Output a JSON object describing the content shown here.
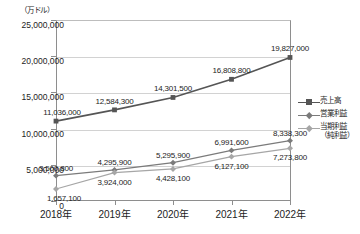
{
  "chart_data": {
    "type": "line",
    "title": "",
    "unit_label": "（万ドル）",
    "xlabel": "",
    "ylabel": "",
    "grid": true,
    "legend_position": "right",
    "categories": [
      "2018年",
      "2019年",
      "2020年",
      "2021年",
      "2022年"
    ],
    "ylim": [
      0,
      25000000
    ],
    "yticks": [
      0,
      5000000,
      10000000,
      15000000,
      20000000,
      25000000
    ],
    "ytick_labels": [
      "0",
      "5,000,000",
      "10,000,000",
      "15,000,000",
      "20,000,000",
      "25,000,000"
    ],
    "series": [
      {
        "name": "売上高",
        "marker": "square",
        "color": "#555555",
        "values": [
          11036000,
          12584300,
          14301500,
          16808800,
          19827000
        ],
        "labels": [
          "11,036,000",
          "12,584,300",
          "14,301,500",
          "16,808,800",
          "19,827,000"
        ]
      },
      {
        "name": "営業利益",
        "marker": "diamond",
        "color": "#7b7b7b",
        "values": [
          3500800,
          4295900,
          5295900,
          6991600,
          8338300
        ],
        "labels": [
          "3,500,800",
          "4,295,900",
          "5,295,900",
          "6,991,600",
          "8,338,300"
        ]
      },
      {
        "name": "当期利益（純利益）",
        "name_line1": "当期利益",
        "name_line2": "（純利益）",
        "marker": "diamond",
        "color": "#a6a6a6",
        "values": [
          1657100,
          3924000,
          4428100,
          6127100,
          7273800
        ],
        "labels": [
          "1,657,100",
          "3,924,000",
          "4,428,100",
          "6,127,100",
          "7,273,800"
        ]
      }
    ]
  },
  "axis": {
    "ytick_0": "0",
    "ytick_1": "5,000,000",
    "ytick_2": "10,000,000",
    "ytick_3": "15,000,000",
    "ytick_4": "20,000,000",
    "ytick_5": "25,000,000",
    "xtick_0": "2018年",
    "xtick_1": "2019年",
    "xtick_2": "2020年",
    "xtick_3": "2021年",
    "xtick_4": "2022年"
  },
  "legend": {
    "item_0": "売上高",
    "item_1": "営業利益",
    "item_2_line1": "当期利益",
    "item_2_line2": "（純利益）"
  },
  "labels": {
    "unit": "（万ドル）",
    "sales": [
      "11,036,000",
      "12,584,300",
      "14,301,500",
      "16,808,800",
      "19,827,000"
    ],
    "operating": [
      "3,500,800",
      "4,295,900",
      "5,295,900",
      "6,991,600",
      "8,338,300"
    ],
    "net": [
      "1,657,100",
      "3,924,000",
      "4,428,100",
      "6,127,100",
      "7,273,800"
    ]
  }
}
